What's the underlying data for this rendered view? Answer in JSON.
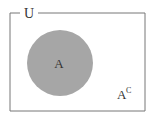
{
  "diagram": {
    "type": "venn",
    "universe_label": "U",
    "set_label": "A",
    "complement_label": "A",
    "complement_superscript": "C",
    "colors": {
      "border": "#777777",
      "set_fill": "#a6a6a6",
      "text": "#333333",
      "background": "#ffffff"
    }
  }
}
